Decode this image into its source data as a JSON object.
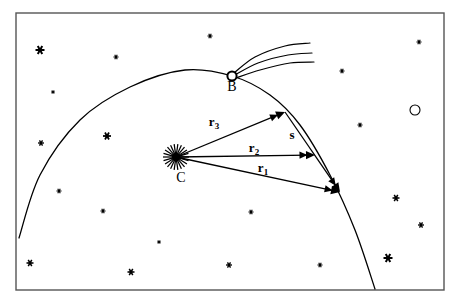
{
  "figure": {
    "background_color": "#ffffff",
    "ink_color": "#000000",
    "frame": {
      "x": 16,
      "y": 13,
      "width": 428,
      "height": 277,
      "stroke": "#555555",
      "stroke_width": 1.4
    }
  },
  "labels": {
    "point_b": "B",
    "point_c": "C",
    "vector_r3_base": "r",
    "vector_r3_sub": "3",
    "vector_r2_base": "r",
    "vector_r2_sub": "2",
    "vector_r1_base": "r",
    "vector_r1_sub": "1",
    "vector_s": "s"
  },
  "chart_data": {
    "type": "scatter",
    "xlabel": "",
    "ylabel": "",
    "xlim": [
      0,
      457
    ],
    "ylim": [
      0,
      303
    ],
    "grid": false,
    "legend": "none",
    "annotations": [
      {
        "name": "B",
        "text": "B",
        "x": 232,
        "y": 90,
        "note": "comet nucleus on orbit arc, open circle with three-line tail"
      },
      {
        "name": "C",
        "text": "C",
        "x": 181,
        "y": 180,
        "note": "radiant / central body, starburst glyph"
      },
      {
        "name": "r3",
        "text": "r3",
        "x": 213,
        "y": 124,
        "note": "vector label, bold with subscript"
      },
      {
        "name": "r2",
        "text": "r2",
        "x": 253,
        "y": 150,
        "note": "vector label, bold with subscript"
      },
      {
        "name": "r1",
        "text": "r1",
        "x": 262,
        "y": 170,
        "note": "vector label, bold with subscript"
      },
      {
        "name": "s",
        "text": "s",
        "x": 291,
        "y": 137,
        "note": "chord vector label, bold"
      }
    ],
    "vectors": [
      {
        "name": "r3",
        "from": [
          176,
          157
        ],
        "to": [
          285,
          112
        ],
        "label": "r3"
      },
      {
        "name": "r2",
        "from": [
          176,
          157
        ],
        "to": [
          315,
          155
        ],
        "label": "r2"
      },
      {
        "name": "r1",
        "from": [
          176,
          157
        ],
        "to": [
          340,
          192
        ],
        "label": "r1"
      },
      {
        "name": "s",
        "from": [
          285,
          112
        ],
        "to": [
          340,
          192
        ],
        "label": "s"
      }
    ],
    "points": [
      {
        "name": "C",
        "x": 176,
        "y": 157,
        "marker": "starburst"
      },
      {
        "name": "B",
        "x": 232,
        "y": 76,
        "marker": "open-circle"
      },
      {
        "name": "P3",
        "x": 285,
        "y": 112,
        "marker": "arrow-tip"
      },
      {
        "name": "P2",
        "x": 315,
        "y": 155,
        "marker": "arrow-tip"
      },
      {
        "name": "P1",
        "x": 340,
        "y": 192,
        "marker": "arrow-tip"
      },
      {
        "name": "faint-disk",
        "x": 415,
        "y": 110,
        "marker": "open-circle"
      }
    ],
    "curves": [
      {
        "name": "orbit-arc",
        "type": "arc",
        "points": [
          [
            19,
            238
          ],
          [
            40,
            175
          ],
          [
            80,
            120
          ],
          [
            130,
            87
          ],
          [
            185,
            70
          ],
          [
            232,
            76
          ],
          [
            270,
            95
          ],
          [
            300,
            125
          ],
          [
            330,
            175
          ],
          [
            355,
            230
          ],
          [
            375,
            289
          ]
        ]
      },
      {
        "name": "tail-1",
        "type": "curve",
        "points": [
          [
            234,
            73
          ],
          [
            255,
            57
          ],
          [
            285,
            46
          ],
          [
            310,
            43
          ]
        ]
      },
      {
        "name": "tail-2",
        "type": "curve",
        "points": [
          [
            235,
            75
          ],
          [
            258,
            63
          ],
          [
            288,
            55
          ],
          [
            312,
            53
          ]
        ]
      },
      {
        "name": "tail-3",
        "type": "curve",
        "points": [
          [
            236,
            78
          ],
          [
            260,
            70
          ],
          [
            290,
            63
          ],
          [
            314,
            62
          ]
        ]
      }
    ],
    "stars": [
      {
        "x": 40,
        "y": 50,
        "size": 9
      },
      {
        "x": 116,
        "y": 57,
        "size": 5
      },
      {
        "x": 210,
        "y": 36,
        "size": 5
      },
      {
        "x": 419,
        "y": 42,
        "size": 5
      },
      {
        "x": 53,
        "y": 92,
        "size": 4
      },
      {
        "x": 342,
        "y": 71,
        "size": 5
      },
      {
        "x": 41,
        "y": 143,
        "size": 6
      },
      {
        "x": 107,
        "y": 136,
        "size": 8
      },
      {
        "x": 360,
        "y": 125,
        "size": 5
      },
      {
        "x": 59,
        "y": 191,
        "size": 5
      },
      {
        "x": 103,
        "y": 211,
        "size": 5
      },
      {
        "x": 251,
        "y": 212,
        "size": 5
      },
      {
        "x": 396,
        "y": 198,
        "size": 7
      },
      {
        "x": 421,
        "y": 225,
        "size": 6
      },
      {
        "x": 30,
        "y": 263,
        "size": 7
      },
      {
        "x": 131,
        "y": 272,
        "size": 7
      },
      {
        "x": 229,
        "y": 265,
        "size": 6
      },
      {
        "x": 320,
        "y": 265,
        "size": 5
      },
      {
        "x": 388,
        "y": 258,
        "size": 9
      },
      {
        "x": 159,
        "y": 242,
        "size": 4
      }
    ]
  }
}
